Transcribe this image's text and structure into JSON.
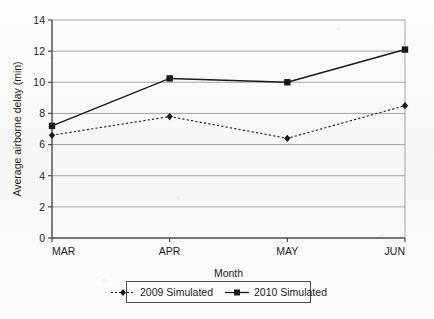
{
  "chart_data": {
    "type": "line",
    "title": "",
    "xlabel": "Month",
    "ylabel": "Average airborne delay (min)",
    "categories": [
      "MAR",
      "APR",
      "MAY",
      "JUN"
    ],
    "ylim": [
      0,
      14
    ],
    "ytick_values": [
      0,
      2,
      4,
      6,
      8,
      10,
      12,
      14
    ],
    "ytick_labels": [
      "0",
      "2",
      "4",
      "6",
      "8",
      "10",
      "12",
      "14"
    ],
    "grid": "horizontal",
    "legend_position": "bottom",
    "series": [
      {
        "name": "2009 Simulated",
        "values": [
          6.6,
          7.8,
          6.4,
          8.5
        ],
        "line_style": "dotted",
        "marker": "diamond",
        "color": "#1a1a1a"
      },
      {
        "name": "2010 Simulated",
        "values": [
          7.2,
          10.25,
          10.0,
          12.1
        ],
        "line_style": "solid",
        "marker": "square",
        "color": "#1a1a1a"
      }
    ]
  },
  "axes": {
    "y_title": "Average airborne delay (min)",
    "x_title": "Month",
    "y_ticks": [
      "14",
      "12",
      "10",
      "8",
      "6",
      "4",
      "2",
      "0"
    ],
    "x_ticks": [
      "MAR",
      "APR",
      "MAY",
      "JUN"
    ]
  },
  "legend": {
    "entries": [
      {
        "label": "2009 Simulated",
        "marker": "diamond-marker",
        "style": "dotted"
      },
      {
        "label": "2010 Simulated",
        "marker": "square-marker",
        "style": "solid"
      }
    ]
  },
  "colors": {
    "ink": "#1a1a1a",
    "grid": "#9a9a9a",
    "axis": "#4a4a4a",
    "paper": "#fbfbfa"
  }
}
